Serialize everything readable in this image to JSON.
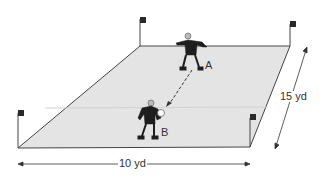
{
  "diagram": {
    "type": "soccer drill field",
    "players": [
      {
        "id": "A",
        "label": "A"
      },
      {
        "id": "B",
        "label": "B"
      }
    ],
    "dimensions": {
      "width_label": "10 yd",
      "depth_label": "15 yd"
    },
    "colors": {
      "field": "#e4e4e4",
      "lines": "#444444",
      "player": "#1e1e1e",
      "flag": "#2a2a2a"
    }
  }
}
